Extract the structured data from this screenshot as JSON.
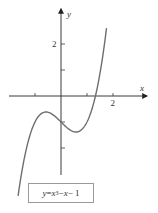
{
  "chart_data": {
    "type": "line",
    "title": "",
    "xlabel": "x",
    "ylabel": "y",
    "xlim": [
      -2.2,
      2.6
    ],
    "ylim": [
      -3.0,
      3.5
    ],
    "x_ticks": [
      -1,
      1,
      2
    ],
    "x_tick_labels": [
      {
        "value": 2,
        "label": "2"
      }
    ],
    "y_ticks": [
      -2,
      -1,
      1,
      2
    ],
    "y_tick_labels": [
      {
        "value": 2,
        "label": "2"
      }
    ],
    "grid": false,
    "legend": "bottom",
    "series": [
      {
        "name": "y = x^3 - x - 1",
        "function": "x^3 - x - 1",
        "x_range": [
          -1.65,
          1.75
        ],
        "color": "#6e6e6e",
        "sample_points": [
          {
            "x": -1.5,
            "y": -2.875
          },
          {
            "x": -1,
            "y": -1
          },
          {
            "x": -0.577,
            "y": -0.615
          },
          {
            "x": 0,
            "y": -1
          },
          {
            "x": 0.577,
            "y": -1.385
          },
          {
            "x": 1,
            "y": -1
          },
          {
            "x": 1.325,
            "y": 0
          },
          {
            "x": 1.5,
            "y": 0.875
          }
        ]
      }
    ]
  },
  "legend": {
    "y": "y",
    "eq": " = ",
    "x1": "x",
    "exp": "3",
    "rest_minus": " − ",
    "x2": "x",
    "tail": " − 1"
  }
}
